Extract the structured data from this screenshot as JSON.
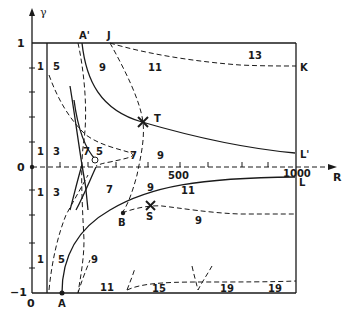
{
  "axes": {
    "y_label": "γ",
    "x_label": "R",
    "y_ticks": {
      "top": "1",
      "middle": "0",
      "bottom": "−1"
    },
    "x_ticks": {
      "origin": "0",
      "mid": "500",
      "end": "1000"
    }
  },
  "points": {
    "A": "A",
    "A_prime": "A'",
    "J": "J",
    "K": "K",
    "L": "L",
    "L_prime": "L'",
    "T": "T",
    "S": "S",
    "B": "B"
  },
  "region_labels": {
    "upper_left_1": "1",
    "upper_5": "5",
    "upper_9": "9",
    "upper_11": "11",
    "upper_13": "13",
    "mid_upper_1": "1",
    "mid_upper_3": "3",
    "mid_upper_7a": "7",
    "mid_upper_5": "5",
    "mid_upper_7b": "7",
    "mid_upper_9": "9",
    "mid_lower_1": "1",
    "mid_lower_3": "3",
    "mid_lower_7": "7",
    "mid_lower_9": "9",
    "mid_lower_11": "11",
    "mid_lower_9b": "9",
    "lower_1": "1",
    "lower_5": "5",
    "lower_9": "9",
    "bottom_11": "11",
    "bottom_15": "15",
    "bottom_19a": "19",
    "bottom_19b": "19"
  }
}
